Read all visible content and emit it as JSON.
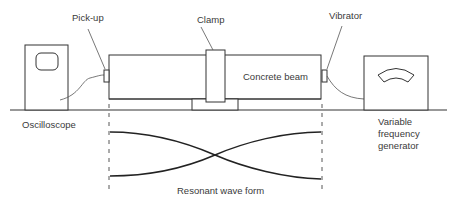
{
  "diagram": {
    "labels": {
      "pickup": "Pick-up",
      "clamp": "Clamp",
      "vibrator": "Vibrator",
      "concrete_beam": "Concrete beam",
      "oscilloscope": "Oscilloscope",
      "generator_line1": "Variable",
      "generator_line2": "frequency",
      "generator_line3": "generator",
      "wave_form": "Resonant wave form"
    },
    "components": [
      {
        "id": "oscilloscope",
        "icon": "oscilloscope-icon"
      },
      {
        "id": "pickup",
        "icon": "pickup-transducer-icon"
      },
      {
        "id": "concrete_beam",
        "icon": "beam-icon"
      },
      {
        "id": "clamp",
        "icon": "clamp-icon"
      },
      {
        "id": "vibrator",
        "icon": "vibrator-transducer-icon"
      },
      {
        "id": "generator",
        "icon": "frequency-generator-icon"
      }
    ],
    "colors": {
      "line": "#333333",
      "text": "#3a3a3a",
      "background": "#ffffff"
    }
  }
}
